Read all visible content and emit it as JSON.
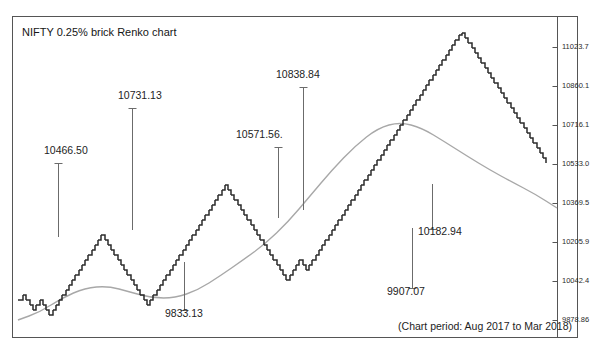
{
  "chart_title": "NIFTY 0.25% brick Renko chart",
  "period_caption": "(Chart period: Aug 2017 to Mar 2018)",
  "style": {
    "brick_color": "#2b2b2b",
    "ma_color": "#a8a8a8",
    "frame_color": "#555555",
    "bg": "#ffffff"
  },
  "chart_data": {
    "type": "line",
    "title": "NIFTY 0.25% brick Renko chart",
    "subtitle": "(Chart period: Aug 2017 to Mar 2018)",
    "xlabel": "",
    "ylabel": "",
    "grid": false,
    "legend": "none",
    "ylim": [
      9797,
      11105
    ],
    "y_ticks": [
      {
        "label": "11023.7",
        "value": 11023.7,
        "y_px": 47
      },
      {
        "label": "10860.1",
        "value": 10860.1,
        "y_px": 86
      },
      {
        "label": "10716.1",
        "value": 10716.1,
        "y_px": 125
      },
      {
        "label": "10533.0",
        "value": 10533.0,
        "y_px": 164
      },
      {
        "label": "10369.5",
        "value": 10369.5,
        "y_px": 203
      },
      {
        "label": "10205.9",
        "value": 10205.9,
        "y_px": 242
      },
      {
        "label": "10042.4",
        "value": 10042.4,
        "y_px": 281
      },
      {
        "label": "9878.86",
        "value": 9878.86,
        "y_px": 320
      }
    ],
    "annotations": [
      {
        "text": "10466.50",
        "value": 10466.5,
        "label_x": 44,
        "label_y": 155,
        "tick_x": 58,
        "tick_top": 163,
        "tick_bottom": 237
      },
      {
        "text": "10731.13",
        "value": 10731.13,
        "label_x": 118,
        "label_y": 100,
        "tick_x": 132,
        "tick_top": 108,
        "tick_bottom": 230
      },
      {
        "text": "10571.56.",
        "value": 10571.56,
        "label_x": 236,
        "label_y": 139,
        "tick_x": 278,
        "tick_top": 147,
        "tick_bottom": 218
      },
      {
        "text": "10838.84",
        "value": 10838.84,
        "label_x": 276,
        "label_y": 79,
        "tick_x": 303,
        "tick_top": 87,
        "tick_bottom": 210
      },
      {
        "text": "9833.13",
        "value": 9833.13,
        "label_x": 165,
        "label_y": 318,
        "tick_x": 184,
        "tick_top": 262,
        "tick_bottom": 311
      },
      {
        "text": "10182.94",
        "value": 10182.94,
        "label_x": 418,
        "label_y": 236,
        "tick_x": 432,
        "tick_top": 184,
        "tick_bottom": 230
      },
      {
        "text": "9907.07",
        "value": 9907.07,
        "label_x": 387,
        "label_y": 296,
        "tick_x": 412,
        "tick_top": 228,
        "tick_bottom": 289
      }
    ],
    "series": [
      {
        "name": "Renko bricks (NIFTY 0.25%)",
        "kind": "renko-staircase",
        "brick_w": 3.3,
        "brick_h": 5.0,
        "points_px": [
          [
            18,
            300
          ],
          [
            23,
            295
          ],
          [
            26,
            300
          ],
          [
            30,
            305
          ],
          [
            33,
            310
          ],
          [
            36,
            305
          ],
          [
            40,
            300
          ],
          [
            43,
            305
          ],
          [
            46,
            310
          ],
          [
            49,
            315
          ],
          [
            53,
            310
          ],
          [
            56,
            305
          ],
          [
            59,
            300
          ],
          [
            62,
            295
          ],
          [
            66,
            290
          ],
          [
            69,
            285
          ],
          [
            72,
            280
          ],
          [
            75,
            275
          ],
          [
            79,
            270
          ],
          [
            82,
            265
          ],
          [
            85,
            260
          ],
          [
            88,
            255
          ],
          [
            92,
            250
          ],
          [
            95,
            245
          ],
          [
            98,
            240
          ],
          [
            101,
            235
          ],
          [
            105,
            240
          ],
          [
            108,
            245
          ],
          [
            111,
            250
          ],
          [
            114,
            255
          ],
          [
            118,
            260
          ],
          [
            121,
            265
          ],
          [
            124,
            270
          ],
          [
            127,
            275
          ],
          [
            131,
            280
          ],
          [
            134,
            285
          ],
          [
            137,
            290
          ],
          [
            140,
            295
          ],
          [
            144,
            300
          ],
          [
            147,
            305
          ],
          [
            150,
            300
          ],
          [
            153,
            295
          ],
          [
            157,
            290
          ],
          [
            160,
            285
          ],
          [
            163,
            280
          ],
          [
            166,
            275
          ],
          [
            170,
            270
          ],
          [
            173,
            265
          ],
          [
            176,
            260
          ],
          [
            179,
            255
          ],
          [
            183,
            250
          ],
          [
            186,
            245
          ],
          [
            189,
            240
          ],
          [
            192,
            235
          ],
          [
            196,
            230
          ],
          [
            199,
            225
          ],
          [
            202,
            220
          ],
          [
            205,
            215
          ],
          [
            209,
            210
          ],
          [
            212,
            205
          ],
          [
            215,
            200
          ],
          [
            218,
            195
          ],
          [
            222,
            190
          ],
          [
            225,
            185
          ],
          [
            228,
            190
          ],
          [
            231,
            195
          ],
          [
            234,
            200
          ],
          [
            238,
            205
          ],
          [
            241,
            210
          ],
          [
            244,
            215
          ],
          [
            247,
            220
          ],
          [
            251,
            225
          ],
          [
            254,
            230
          ],
          [
            257,
            235
          ],
          [
            260,
            240
          ],
          [
            264,
            245
          ],
          [
            267,
            250
          ],
          [
            270,
            255
          ],
          [
            273,
            260
          ],
          [
            277,
            265
          ],
          [
            280,
            270
          ],
          [
            283,
            275
          ],
          [
            286,
            280
          ],
          [
            290,
            275
          ],
          [
            293,
            270
          ],
          [
            296,
            265
          ],
          [
            299,
            260
          ],
          [
            303,
            265
          ],
          [
            306,
            270
          ],
          [
            309,
            265
          ],
          [
            312,
            260
          ],
          [
            316,
            255
          ],
          [
            319,
            250
          ],
          [
            322,
            245
          ],
          [
            325,
            240
          ],
          [
            329,
            235
          ],
          [
            332,
            230
          ],
          [
            335,
            225
          ],
          [
            338,
            220
          ],
          [
            342,
            215
          ],
          [
            345,
            210
          ],
          [
            348,
            205
          ],
          [
            351,
            200
          ],
          [
            355,
            195
          ],
          [
            358,
            190
          ],
          [
            361,
            185
          ],
          [
            364,
            180
          ],
          [
            368,
            175
          ],
          [
            371,
            170
          ],
          [
            374,
            165
          ],
          [
            377,
            160
          ],
          [
            381,
            155
          ],
          [
            384,
            150
          ],
          [
            387,
            145
          ],
          [
            390,
            140
          ],
          [
            394,
            135
          ],
          [
            397,
            130
          ],
          [
            400,
            125
          ],
          [
            403,
            120
          ],
          [
            407,
            115
          ],
          [
            410,
            110
          ],
          [
            413,
            105
          ],
          [
            416,
            100
          ],
          [
            420,
            95
          ],
          [
            423,
            90
          ],
          [
            426,
            85
          ],
          [
            429,
            80
          ],
          [
            433,
            75
          ],
          [
            436,
            70
          ],
          [
            439,
            65
          ],
          [
            442,
            60
          ],
          [
            446,
            55
          ],
          [
            449,
            50
          ],
          [
            452,
            45
          ],
          [
            455,
            40
          ],
          [
            459,
            35
          ],
          [
            462,
            33
          ],
          [
            465,
            38
          ],
          [
            468,
            43
          ],
          [
            472,
            48
          ],
          [
            475,
            53
          ],
          [
            478,
            58
          ],
          [
            481,
            63
          ],
          [
            485,
            68
          ],
          [
            488,
            73
          ],
          [
            491,
            78
          ],
          [
            494,
            83
          ],
          [
            498,
            88
          ],
          [
            501,
            93
          ],
          [
            504,
            98
          ],
          [
            507,
            103
          ],
          [
            511,
            108
          ],
          [
            514,
            113
          ],
          [
            517,
            118
          ],
          [
            520,
            123
          ],
          [
            524,
            128
          ],
          [
            527,
            133
          ],
          [
            530,
            138
          ],
          [
            533,
            143
          ],
          [
            537,
            148
          ],
          [
            540,
            153
          ],
          [
            543,
            158
          ],
          [
            546,
            163
          ]
        ]
      },
      {
        "name": "Moving average",
        "kind": "smooth-line",
        "points_px": [
          [
            18,
            320
          ],
          [
            40,
            312
          ],
          [
            62,
            298
          ],
          [
            85,
            288
          ],
          [
            108,
            286
          ],
          [
            130,
            292
          ],
          [
            152,
            298
          ],
          [
            175,
            298
          ],
          [
            198,
            290
          ],
          [
            220,
            276
          ],
          [
            243,
            260
          ],
          [
            265,
            244
          ],
          [
            288,
            222
          ],
          [
            310,
            196
          ],
          [
            332,
            170
          ],
          [
            355,
            146
          ],
          [
            378,
            128
          ],
          [
            400,
            122
          ],
          [
            422,
            128
          ],
          [
            445,
            142
          ],
          [
            467,
            156
          ],
          [
            490,
            170
          ],
          [
            512,
            182
          ],
          [
            535,
            194
          ],
          [
            557,
            208
          ]
        ]
      }
    ]
  }
}
